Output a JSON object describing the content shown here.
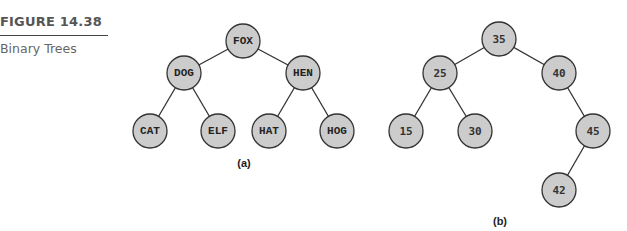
{
  "figure": {
    "number": "FIGURE 14.38",
    "title": "Binary Trees"
  },
  "trees": {
    "a": {
      "label": "(a)",
      "nodes": {
        "root": "FOX",
        "left": "DOG",
        "right": "HEN",
        "left_left": "CAT",
        "left_right": "ELF",
        "right_left": "HAT",
        "right_right": "HOG"
      }
    },
    "b": {
      "label": "(b)",
      "nodes": {
        "root": "35",
        "left": "25",
        "right": "40",
        "left_left": "15",
        "left_right": "30",
        "right_right": "45",
        "right_right_left": "42"
      }
    }
  },
  "colors": {
    "node_fill": "#cccccc",
    "node_stroke": "#333333",
    "caption_text": "#555555"
  }
}
